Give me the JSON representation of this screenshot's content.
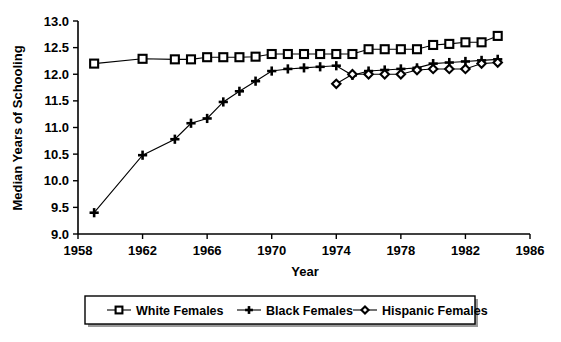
{
  "figure": {
    "top_cropped_remnant": "",
    "axis_label_x": "Year",
    "axis_label_y": "Median Years of Schooling"
  },
  "legend": {
    "position": "bottom-center",
    "entries": [
      {
        "label": "White Females",
        "marker": "square"
      },
      {
        "label": "Black Females",
        "marker": "plus"
      },
      {
        "label": "Hispanic Females",
        "marker": "diamond"
      }
    ]
  },
  "axes": {
    "x_ticks": [
      "1958",
      "1962",
      "1966",
      "1970",
      "1974",
      "1978",
      "1982",
      "1986"
    ],
    "y_ticks": [
      "9.0",
      "9.5",
      "10.0",
      "10.5",
      "11.0",
      "11.5",
      "12.0",
      "12.5",
      "13.0"
    ]
  },
  "chart_data": {
    "type": "line",
    "title": "",
    "xlabel": "Year",
    "ylabel": "Median Years of Schooling",
    "xlim": [
      1958,
      1986
    ],
    "ylim": [
      9.0,
      13.0
    ],
    "xticks": [
      1958,
      1962,
      1966,
      1970,
      1974,
      1978,
      1982,
      1986
    ],
    "yticks": [
      9.0,
      9.5,
      10.0,
      10.5,
      11.0,
      11.5,
      12.0,
      12.5,
      13.0
    ],
    "grid": false,
    "legend_position": "bottom-center",
    "series": [
      {
        "name": "White Females",
        "marker": "square",
        "x": [
          1959,
          1962,
          1964,
          1965,
          1966,
          1967,
          1968,
          1969,
          1970,
          1971,
          1972,
          1973,
          1974,
          1975,
          1976,
          1977,
          1978,
          1979,
          1980,
          1981,
          1982,
          1983,
          1984
        ],
        "values": [
          12.2,
          12.29,
          12.28,
          12.28,
          12.32,
          12.32,
          12.32,
          12.33,
          12.38,
          12.38,
          12.38,
          12.38,
          12.38,
          12.38,
          12.47,
          12.47,
          12.47,
          12.47,
          12.55,
          12.57,
          12.6,
          12.6,
          12.72
        ]
      },
      {
        "name": "Black Females",
        "marker": "plus",
        "x": [
          1959,
          1962,
          1964,
          1965,
          1966,
          1967,
          1968,
          1969,
          1970,
          1971,
          1972,
          1973,
          1974,
          1975,
          1976,
          1977,
          1978,
          1979,
          1980,
          1981,
          1982,
          1983,
          1984
        ],
        "values": [
          9.4,
          10.48,
          10.78,
          11.08,
          11.17,
          11.48,
          11.68,
          11.87,
          12.06,
          12.1,
          12.12,
          12.14,
          12.16,
          11.98,
          12.06,
          12.08,
          12.1,
          12.12,
          12.2,
          12.22,
          12.24,
          12.26,
          12.28
        ]
      },
      {
        "name": "Hispanic Females",
        "marker": "diamond",
        "x": [
          1974,
          1975,
          1976,
          1977,
          1978,
          1979,
          1980,
          1981,
          1982,
          1983,
          1984
        ],
        "values": [
          11.82,
          12.0,
          12.0,
          12.0,
          12.0,
          12.08,
          12.1,
          12.1,
          12.1,
          12.2,
          12.22
        ]
      }
    ]
  }
}
